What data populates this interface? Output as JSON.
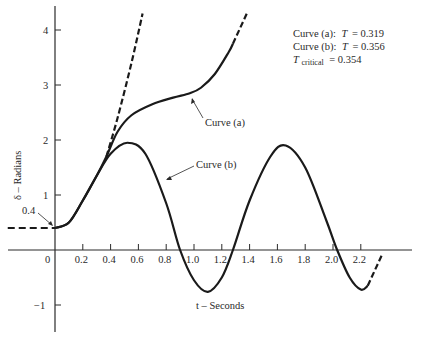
{
  "chart_data": {
    "type": "line",
    "title": "",
    "xlabel": "t – Seconds",
    "ylabel": "δ – Radians",
    "xlim": [
      -0.35,
      2.55
    ],
    "ylim": [
      -1.5,
      4.4
    ],
    "x_ticks": [
      "0",
      "0.2",
      "0.4",
      "0.6",
      "0.8",
      "1.0",
      "1.2",
      "1.4",
      "1.6",
      "1.8",
      "2.0",
      "2.2"
    ],
    "y_ticks": [
      "-1",
      "1",
      "2",
      "3",
      "4"
    ],
    "grid": false,
    "legend_position": "upper-right",
    "legend": [
      {
        "curve": "Curve (a):",
        "var": "T",
        "value": "= 0.319"
      },
      {
        "curve": "Curve (b):",
        "var": "T",
        "value": "= 0.356"
      },
      {
        "var": "T",
        "sub": "critical",
        "value": "= 0.354"
      }
    ],
    "annotations": [
      {
        "text": "Curve (a)",
        "points_to": [
          0.98,
          2.85
        ]
      },
      {
        "text": "Curve (b)",
        "points_to": [
          0.79,
          1.3
        ]
      },
      {
        "text": "0.4",
        "points_to": [
          0.0,
          0.4
        ]
      }
    ],
    "series": [
      {
        "name": "Curve (a)",
        "T": 0.319,
        "style": "solid then dashed (unstable, diverging)",
        "x": [
          0.0,
          0.1,
          0.2,
          0.3,
          0.37,
          0.45,
          0.55,
          0.7,
          0.85,
          0.97,
          1.05,
          1.15,
          1.25,
          1.28,
          1.38
        ],
        "y": [
          0.4,
          0.5,
          0.9,
          1.35,
          1.7,
          2.15,
          2.45,
          2.65,
          2.77,
          2.85,
          2.95,
          3.2,
          3.6,
          3.75,
          4.3
        ]
      },
      {
        "name": "Curve (a) divergent branch",
        "style": "dashed",
        "x": [
          0.37,
          0.45,
          0.55,
          0.63
        ],
        "y": [
          1.7,
          2.4,
          3.4,
          4.3
        ]
      },
      {
        "name": "Curve (b)",
        "T": 0.356,
        "style": "solid (stable, oscillating)",
        "x": [
          0.0,
          0.1,
          0.2,
          0.3,
          0.4,
          0.52,
          0.65,
          0.8,
          0.9,
          1.0,
          1.1,
          1.2,
          1.28,
          1.4,
          1.55,
          1.66,
          1.8,
          1.95,
          2.03,
          2.12,
          2.2,
          2.25,
          2.35
        ],
        "y": [
          0.4,
          0.5,
          0.9,
          1.35,
          1.75,
          1.95,
          1.75,
          0.85,
          0.0,
          -0.55,
          -0.76,
          -0.5,
          0.0,
          0.9,
          1.7,
          1.9,
          1.5,
          0.55,
          0.0,
          -0.5,
          -0.72,
          -0.65,
          -0.1
        ]
      },
      {
        "name": "Initial condition (pre-fault)",
        "style": "dashed",
        "x": [
          -0.34,
          0.0
        ],
        "y": [
          0.4,
          0.4
        ]
      }
    ]
  }
}
